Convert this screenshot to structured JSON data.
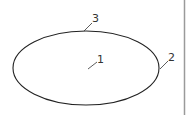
{
  "diagram": {
    "shape": "ellipse",
    "labels": [
      {
        "id": "1",
        "text": "1",
        "target": "interior"
      },
      {
        "id": "2",
        "text": "2",
        "target": "right edge"
      },
      {
        "id": "3",
        "text": "3",
        "target": "top edge"
      }
    ],
    "stroke_color": "#222222",
    "border_color": "#9a9a9a"
  }
}
